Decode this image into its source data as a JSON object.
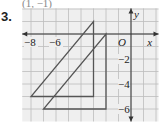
{
  "problem": {
    "number": "3.",
    "answer_label": "(1, −1)"
  },
  "graph": {
    "origin_label": "O",
    "x_axis_label": "x",
    "y_axis_label": "y",
    "x_tick_labels": [
      "−8",
      "−6"
    ],
    "y_tick_labels": [
      "−2",
      "−4",
      "−6"
    ],
    "grid_color": "#bcbcbc",
    "background": "#efefef",
    "shape_color": "#555555"
  },
  "chart_data": {
    "type": "diagram",
    "grid": {
      "x_range": [
        -9,
        2
      ],
      "y_range": [
        -7,
        2
      ],
      "step": 1
    },
    "shapes": [
      {
        "name": "preimage triangle",
        "vertices": [
          [
            -8,
            -5
          ],
          [
            -3,
            -5
          ],
          [
            -3,
            1
          ]
        ]
      },
      {
        "name": "image triangle",
        "vertices": [
          [
            -7,
            -6
          ],
          [
            -2,
            -6
          ],
          [
            -2,
            0
          ]
        ]
      }
    ],
    "translation": [
      1,
      -1
    ]
  }
}
